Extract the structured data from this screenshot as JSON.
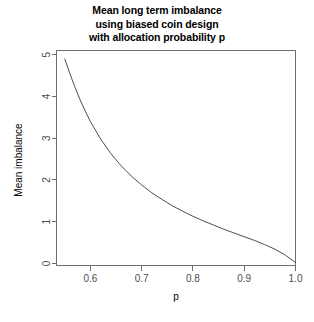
{
  "figure": {
    "title_lines": [
      "Mean long term imbalance",
      "using biased coin design",
      "with allocation probability p"
    ],
    "title_line_1": "Mean long term imbalance",
    "title_line_2": "using biased coin design",
    "title_line_3": "with allocation probability p",
    "background_color": "#ffffff",
    "curve_color": "#3a3a3a",
    "axis_color": "#6e6e6e"
  },
  "chart_data": {
    "type": "line",
    "title": "Mean long term imbalance using biased coin design with allocation probability p",
    "xlabel": "p",
    "ylabel": "Mean imbalance",
    "xlim": [
      0.534,
      1.0
    ],
    "ylim": [
      -0.05,
      5.1
    ],
    "xticks": [
      0.6,
      0.7,
      0.8,
      0.9,
      1.0
    ],
    "xtick_labels": [
      "0.6",
      "0.7",
      "0.8",
      "0.9",
      "1.0"
    ],
    "yticks": [
      0,
      1,
      2,
      3,
      4,
      5
    ],
    "ytick_labels": [
      "0",
      "1",
      "2",
      "3",
      "4",
      "5"
    ],
    "grid": false,
    "legend": false,
    "box": true,
    "series": [
      {
        "name": "mean imbalance",
        "x": [
          0.55,
          0.56,
          0.57,
          0.58,
          0.59,
          0.6,
          0.62,
          0.64,
          0.66,
          0.68,
          0.7,
          0.72,
          0.74,
          0.76,
          0.78,
          0.8,
          0.82,
          0.84,
          0.86,
          0.88,
          0.9,
          0.92,
          0.94,
          0.96,
          0.98,
          1.0
        ],
        "y": [
          4.9,
          4.55,
          4.22,
          3.92,
          3.65,
          3.4,
          2.98,
          2.63,
          2.34,
          2.09,
          1.88,
          1.69,
          1.53,
          1.38,
          1.25,
          1.13,
          1.02,
          0.92,
          0.82,
          0.73,
          0.64,
          0.55,
          0.45,
          0.34,
          0.2,
          0.02
        ]
      }
    ]
  }
}
